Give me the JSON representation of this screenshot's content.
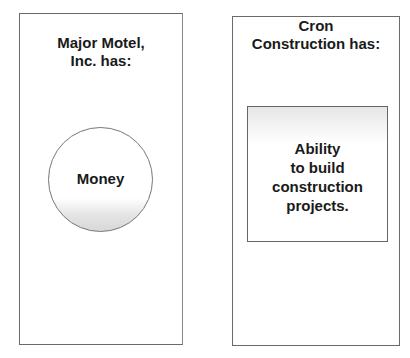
{
  "left_panel": {
    "title_lines": [
      "Major Motel,",
      "Inc. has:"
    ],
    "shape": "circle",
    "shape_label": "Money"
  },
  "right_panel": {
    "title_lines": [
      "Cron",
      "Construction has:"
    ],
    "shape": "rectangle",
    "shape_label_lines": [
      "Ability",
      "to build",
      "construction",
      "projects."
    ]
  },
  "colors": {
    "border": "#6a6a6a",
    "text": "#1a1a1a",
    "shading": "#d8d8d8"
  }
}
